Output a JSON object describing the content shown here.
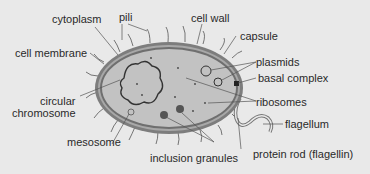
{
  "diagram": {
    "labels": {
      "cytoplasm": "cytoplasm",
      "pili": "pili",
      "cell_wall": "cell wall",
      "capsule": "capsule",
      "cell_membrane": "cell membrane",
      "plasmids": "plasmids",
      "basal_complex": "basal complex",
      "circular_chromosome_1": "circular",
      "circular_chromosome_2": "chromosome",
      "ribosomes": "ribosomes",
      "flagellum": "flagellum",
      "mesosome": "mesosome",
      "inclusion_granules": "inclusion granules",
      "protein_rod": "protein rod (flagellin)"
    },
    "colors": {
      "background": "#e9e9e9",
      "cytoplasm": "#c2c2c2",
      "capsule": "#7d7d7d",
      "wall": "#a8a8a8",
      "line": "#555555",
      "text": "#2a2a2a"
    }
  }
}
